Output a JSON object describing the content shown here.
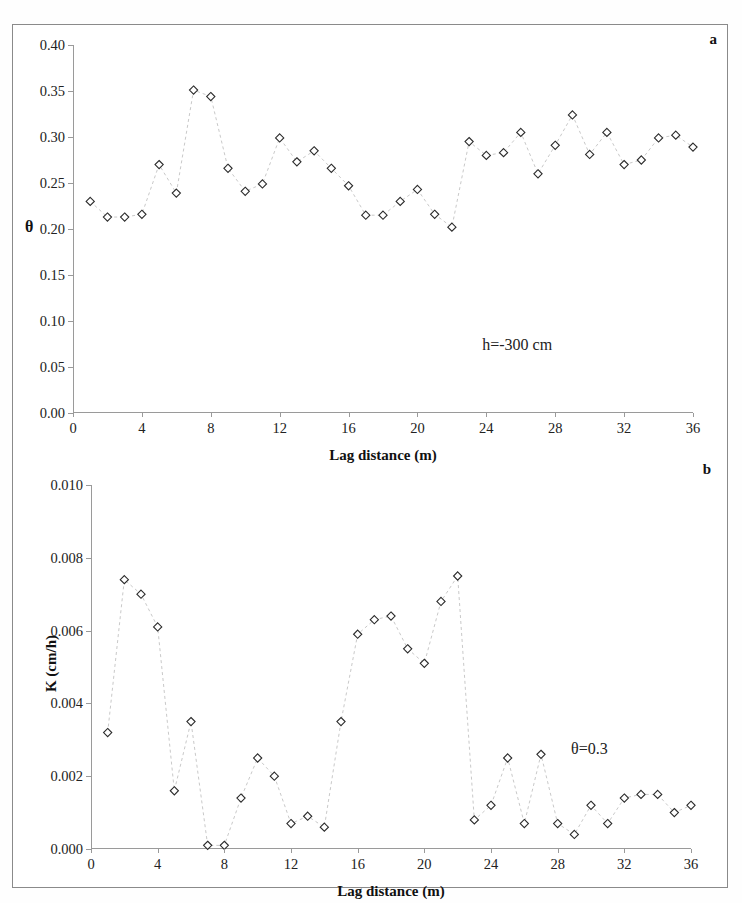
{
  "figure": {
    "panel_a_label": "a",
    "panel_b_label": "b"
  },
  "chart_data": [
    {
      "type": "scatter",
      "panel": "a",
      "title": "",
      "xlabel": "Lag distance (m)",
      "ylabel": "θ",
      "annotation": "h=-300 cm",
      "xlim": [
        0,
        36
      ],
      "ylim": [
        0.0,
        0.4
      ],
      "xticks": [
        0,
        4,
        8,
        12,
        16,
        20,
        24,
        28,
        32,
        36
      ],
      "xticklabels": [
        "0",
        "4",
        "8",
        "12",
        "16",
        "20",
        "24",
        "28",
        "32",
        "36"
      ],
      "yticks": [
        0.0,
        0.05,
        0.1,
        0.15,
        0.2,
        0.25,
        0.3,
        0.35,
        0.4
      ],
      "yticklabels": [
        "0.00",
        "0.05",
        "0.10",
        "0.15",
        "0.20",
        "0.25",
        "0.30",
        "0.35",
        "0.40"
      ],
      "grid": false,
      "legend": "none",
      "marker": "open-diamond",
      "line_style": "dashed",
      "x": [
        1,
        2,
        3,
        4,
        5,
        6,
        7,
        8,
        9,
        10,
        11,
        12,
        13,
        14,
        15,
        16,
        17,
        18,
        19,
        20,
        21,
        22,
        23,
        24,
        25,
        26,
        27,
        28,
        29,
        30,
        31,
        32,
        33,
        34,
        35,
        36
      ],
      "values": [
        0.23,
        0.213,
        0.213,
        0.216,
        0.27,
        0.239,
        0.351,
        0.344,
        0.266,
        0.241,
        0.249,
        0.299,
        0.273,
        0.285,
        0.266,
        0.247,
        0.215,
        0.215,
        0.23,
        0.243,
        0.216,
        0.202,
        0.295,
        0.28,
        0.283,
        0.305,
        0.26,
        0.291,
        0.324,
        0.281,
        0.305,
        0.27,
        0.275,
        0.299,
        0.302,
        0.289
      ]
    },
    {
      "type": "scatter",
      "panel": "b",
      "title": "",
      "xlabel": "Lag distance (m)",
      "ylabel": "K (cm/h)",
      "annotation": "θ=0.3",
      "xlim": [
        0,
        36
      ],
      "ylim": [
        0.0,
        0.01
      ],
      "xticks": [
        0,
        4,
        8,
        12,
        16,
        20,
        24,
        28,
        32,
        36
      ],
      "xticklabels": [
        "0",
        "4",
        "8",
        "12",
        "16",
        "20",
        "24",
        "28",
        "32",
        "36"
      ],
      "yticks": [
        0.0,
        0.002,
        0.004,
        0.006,
        0.008,
        0.01
      ],
      "yticklabels": [
        "0.000",
        "0.002",
        "0.004",
        "0.006",
        "0.008",
        "0.010"
      ],
      "grid": false,
      "legend": "none",
      "marker": "open-diamond",
      "line_style": "dashed",
      "x": [
        1,
        2,
        3,
        4,
        5,
        6,
        7,
        8,
        9,
        10,
        11,
        12,
        13,
        14,
        15,
        16,
        17,
        18,
        19,
        20,
        21,
        22,
        23,
        24,
        25,
        26,
        27,
        28,
        29,
        30,
        31,
        32,
        33,
        34,
        35,
        36
      ],
      "values": [
        0.0032,
        0.0074,
        0.007,
        0.0061,
        0.0016,
        0.0035,
        0.0001,
        0.0001,
        0.0014,
        0.0025,
        0.002,
        0.0007,
        0.0009,
        0.0006,
        0.0035,
        0.0059,
        0.0063,
        0.0064,
        0.0055,
        0.0051,
        0.0068,
        0.0075,
        0.0008,
        0.0012,
        0.0025,
        0.0007,
        0.0026,
        0.0007,
        0.0004,
        0.0012,
        0.0007,
        0.0014,
        0.0015,
        0.0015,
        0.001,
        0.0012
      ]
    }
  ]
}
